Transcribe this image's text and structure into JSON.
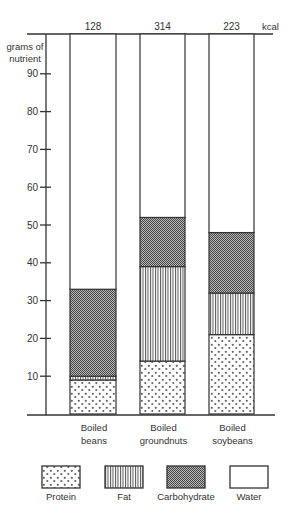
{
  "chart_data": {
    "type": "bar",
    "stacked": true,
    "title": "",
    "ylabel": "grams of nutrient",
    "xlabel": "",
    "ylim": [
      0,
      100
    ],
    "yticks": [
      10,
      20,
      30,
      40,
      50,
      60,
      70,
      80,
      90
    ],
    "top_axis_label": "kcal",
    "categories": [
      "Boiled beans",
      "Boiled groundnuts",
      "Boiled soybeans"
    ],
    "category_lines": [
      [
        "Boiled",
        "beans"
      ],
      [
        "Boiled",
        "groundnuts"
      ],
      [
        "Boiled",
        "soybeans"
      ]
    ],
    "kcal": [
      128,
      314,
      223
    ],
    "series": [
      {
        "name": "Protein",
        "pattern": "dots",
        "values": [
          9,
          14,
          21
        ]
      },
      {
        "name": "Fat",
        "pattern": "vertical-stripes",
        "values": [
          1,
          25,
          11
        ]
      },
      {
        "name": "Carbohydrate",
        "pattern": "checkerboard",
        "values": [
          23,
          13,
          16
        ]
      },
      {
        "name": "Water",
        "pattern": "blank",
        "values": [
          67,
          48,
          52
        ]
      }
    ],
    "grid": false,
    "legend_position": "bottom"
  },
  "legend": [
    "Protein",
    "Fat",
    "Carbohydrate",
    "Water"
  ],
  "colors": {
    "ink": "#333333",
    "background": "#ffffff"
  }
}
